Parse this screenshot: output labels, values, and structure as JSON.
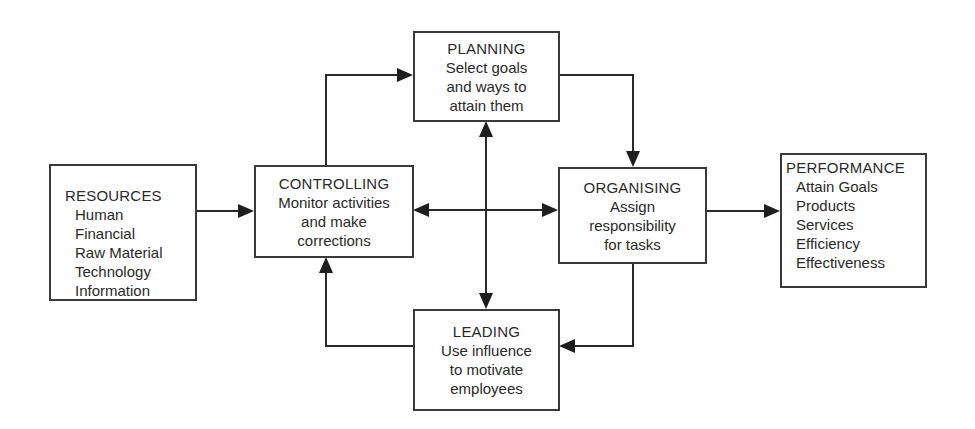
{
  "diagram": {
    "resources": {
      "title": "RESOURCES",
      "items": [
        "Human",
        "Financial",
        "Raw Material",
        "Technology",
        "Information"
      ]
    },
    "controlling": {
      "title": "CONTROLLING",
      "lines": [
        "Monitor activities",
        "and make",
        "corrections"
      ]
    },
    "planning": {
      "title": "PLANNING",
      "lines": [
        "Select goals",
        "and ways to",
        "attain them"
      ]
    },
    "organising": {
      "title": "ORGANISING",
      "lines": [
        "Assign",
        "responsibility",
        "for tasks"
      ]
    },
    "leading": {
      "title": "LEADING",
      "lines": [
        "Use influence",
        "to motivate",
        "employees"
      ]
    },
    "performance": {
      "title": "PERFORMANCE",
      "items": [
        "Attain Goals",
        "Products",
        "Services",
        "Efficiency",
        "Effectiveness"
      ]
    },
    "connections": [
      {
        "from": "resources",
        "to": "controlling",
        "type": "arrow"
      },
      {
        "from": "controlling",
        "to": "planning",
        "type": "arrow"
      },
      {
        "from": "planning",
        "to": "organising",
        "type": "arrow"
      },
      {
        "from": "organising",
        "to": "leading",
        "type": "arrow"
      },
      {
        "from": "leading",
        "to": "controlling",
        "type": "arrow"
      },
      {
        "from": "planning",
        "to": "leading",
        "type": "double-arrow"
      },
      {
        "from": "controlling",
        "to": "organising",
        "type": "double-arrow"
      },
      {
        "from": "organising",
        "to": "performance",
        "type": "arrow"
      }
    ],
    "colors": {
      "line": "#2a2a2a",
      "background": "#ffffff"
    }
  }
}
